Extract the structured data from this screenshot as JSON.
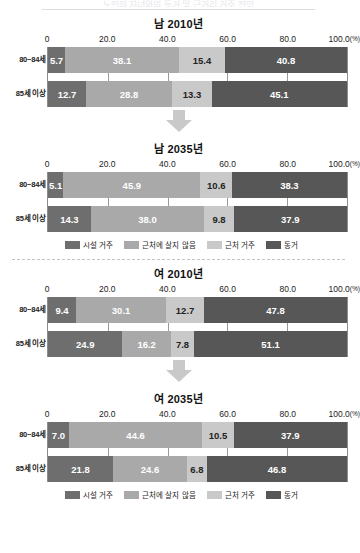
{
  "header": {
    "cut_off_text": "노인의 자녀와의 동거 및 근거리 거주 전망",
    "rule_color": "#dcdcdc"
  },
  "axis": {
    "ticks": [
      "0",
      "20.0",
      "40.0",
      "60.0",
      "80.0",
      "100.0"
    ],
    "unit_suffix": "(%)",
    "min": 0,
    "max": 100
  },
  "legend": {
    "items": [
      {
        "label": "시설 거주",
        "color": "#6e6e6e",
        "key": "s1"
      },
      {
        "label": "근처에 살지 않음",
        "color": "#a9a9a9",
        "key": "s2"
      },
      {
        "label": "근처 거주",
        "color": "#c9c9c9",
        "key": "s3"
      },
      {
        "label": "동거",
        "color": "#575757",
        "key": "s4"
      }
    ]
  },
  "arrow": {
    "name": "down-arrow",
    "color": "#c9c9c9"
  },
  "chart_data": [
    {
      "type": "bar",
      "orientation": "horizontal",
      "stacked": true,
      "title": "남 2010년",
      "xlabel": "",
      "ylabel": "",
      "xlim": [
        0,
        100
      ],
      "unit": "%",
      "grid": true,
      "legend_position": "bottom",
      "categories": [
        "80~84세",
        "85세 이상"
      ],
      "series": [
        {
          "name": "시설 거주",
          "values": [
            5.7,
            12.7
          ]
        },
        {
          "name": "근처에 살지 않음",
          "values": [
            38.1,
            28.8
          ]
        },
        {
          "name": "근처 거주",
          "values": [
            15.4,
            13.3
          ]
        },
        {
          "name": "동거",
          "values": [
            40.8,
            45.1
          ]
        }
      ]
    },
    {
      "type": "bar",
      "orientation": "horizontal",
      "stacked": true,
      "title": "남 2035년",
      "xlabel": "",
      "ylabel": "",
      "xlim": [
        0,
        100
      ],
      "unit": "%",
      "grid": true,
      "legend_position": "bottom",
      "categories": [
        "80~84세",
        "85세 이상"
      ],
      "series": [
        {
          "name": "시설 거주",
          "values": [
            5.1,
            14.3
          ]
        },
        {
          "name": "근처에 살지 않음",
          "values": [
            45.9,
            38.0
          ]
        },
        {
          "name": "근처 거주",
          "values": [
            10.6,
            9.8
          ]
        },
        {
          "name": "동거",
          "values": [
            38.3,
            37.9
          ]
        }
      ]
    },
    {
      "type": "bar",
      "orientation": "horizontal",
      "stacked": true,
      "title": "여 2010년",
      "xlabel": "",
      "ylabel": "",
      "xlim": [
        0,
        100
      ],
      "unit": "%",
      "grid": true,
      "legend_position": "bottom",
      "categories": [
        "80~84세",
        "85세 이상"
      ],
      "series": [
        {
          "name": "시설 거주",
          "values": [
            9.4,
            24.9
          ]
        },
        {
          "name": "근처에 살지 않음",
          "values": [
            30.1,
            16.2
          ]
        },
        {
          "name": "근처 거주",
          "values": [
            12.7,
            7.8
          ]
        },
        {
          "name": "동거",
          "values": [
            47.8,
            51.1
          ]
        }
      ]
    },
    {
      "type": "bar",
      "orientation": "horizontal",
      "stacked": true,
      "title": "여 2035년",
      "xlabel": "",
      "ylabel": "",
      "xlim": [
        0,
        100
      ],
      "unit": "%",
      "grid": true,
      "legend_position": "bottom",
      "categories": [
        "80~84세",
        "85세 이상"
      ],
      "series": [
        {
          "name": "시설 거주",
          "values": [
            7.0,
            21.8
          ]
        },
        {
          "name": "근처에 살지 않음",
          "values": [
            44.6,
            24.6
          ]
        },
        {
          "name": "근처 거주",
          "values": [
            10.5,
            6.8
          ]
        },
        {
          "name": "동거",
          "values": [
            37.9,
            46.8
          ]
        }
      ]
    }
  ]
}
